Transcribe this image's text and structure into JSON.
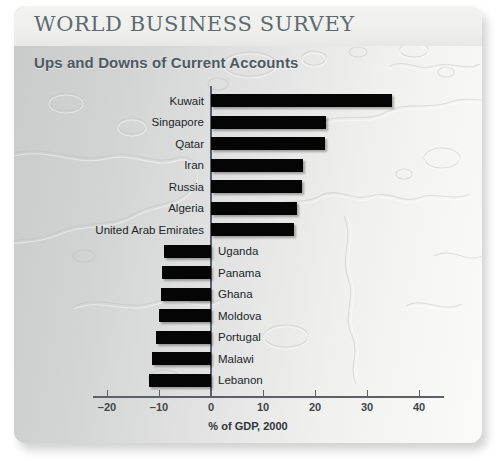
{
  "header": {
    "title": "WORLD BUSINESS SURVEY",
    "subtitle": "Ups and Downs of Current Accounts"
  },
  "colors": {
    "bar": "#050505",
    "axis": "#5b6166",
    "title_text": "#5d6a70",
    "subtitle_text": "#4e5a61",
    "panel_light": "#fafaf9",
    "panel_dark": "#c8cbca"
  },
  "chart_data": {
    "type": "bar",
    "orientation": "horizontal",
    "title": "Ups and Downs of Current Accounts",
    "xlabel": "% of GDP, 2000",
    "ylabel": "",
    "xlim": [
      -22,
      44
    ],
    "xticks": [
      -20,
      -10,
      0,
      10,
      20,
      30,
      40
    ],
    "xticklabels": [
      "–20",
      "–10",
      "0",
      "10",
      "20",
      "30",
      "40"
    ],
    "grid": false,
    "legend": null,
    "categories": [
      "Kuwait",
      "Singapore",
      "Qatar",
      "Iran",
      "Russia",
      "Algeria",
      "United Arab Emirates",
      "Uganda",
      "Panama",
      "Ghana",
      "Moldova",
      "Portugal",
      "Malawi",
      "Lebanon"
    ],
    "values": [
      34.8,
      22.1,
      22.0,
      17.7,
      17.5,
      16.5,
      16.0,
      -9.0,
      -9.4,
      -9.6,
      -10.0,
      -10.6,
      -11.3,
      -12.0
    ],
    "bars": [
      {
        "label": "Kuwait",
        "value": 34.8,
        "sign": "positive"
      },
      {
        "label": "Singapore",
        "value": 22.1,
        "sign": "positive"
      },
      {
        "label": "Qatar",
        "value": 22.0,
        "sign": "positive"
      },
      {
        "label": "Iran",
        "value": 17.7,
        "sign": "positive"
      },
      {
        "label": "Russia",
        "value": 17.5,
        "sign": "positive"
      },
      {
        "label": "Algeria",
        "value": 16.5,
        "sign": "positive"
      },
      {
        "label": "United Arab Emirates",
        "value": 16.0,
        "sign": "positive"
      },
      {
        "label": "Uganda",
        "value": -9.0,
        "sign": "negative"
      },
      {
        "label": "Panama",
        "value": -9.4,
        "sign": "negative"
      },
      {
        "label": "Ghana",
        "value": -9.6,
        "sign": "negative"
      },
      {
        "label": "Moldova",
        "value": -10.0,
        "sign": "negative"
      },
      {
        "label": "Portugal",
        "value": -10.6,
        "sign": "negative"
      },
      {
        "label": "Malawi",
        "value": -11.3,
        "sign": "negative"
      },
      {
        "label": "Lebanon",
        "value": -12.0,
        "sign": "negative"
      }
    ]
  }
}
